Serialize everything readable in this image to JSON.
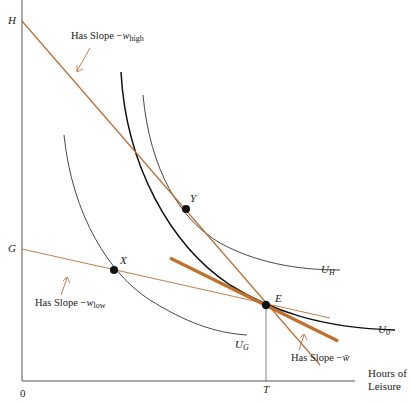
{
  "figure": {
    "type": "economics labor-leisure diagram",
    "axes": {
      "x_label_line1": "Hours of",
      "x_label_line2": "Leisure",
      "origin": "0",
      "y_intercepts": [
        "H",
        "G"
      ],
      "x_tick": "T"
    },
    "points": [
      {
        "name": "X",
        "label": "X"
      },
      {
        "name": "Y",
        "label": "Y"
      },
      {
        "name": "E",
        "label": "E"
      }
    ],
    "curves": [
      {
        "name": "U_0",
        "label": "U",
        "subscript": "0"
      },
      {
        "name": "U_H",
        "label": "U",
        "subscript": "H"
      },
      {
        "name": "U_G",
        "label": "U",
        "subscript": "G"
      }
    ],
    "annotations": {
      "high": {
        "prefix": "Has Slope −",
        "var": "w",
        "sub": "high"
      },
      "low": {
        "prefix": "Has Slope −",
        "var": "w",
        "sub": "low"
      },
      "avg": {
        "prefix": "Has Slope −",
        "var": "w̄"
      }
    },
    "colors": {
      "budget_line": "#b8733a",
      "budget_line_thick": "#c0702a",
      "curve": "#1a1a1a",
      "axis": "#555555",
      "arrow": "#c0703a"
    }
  }
}
